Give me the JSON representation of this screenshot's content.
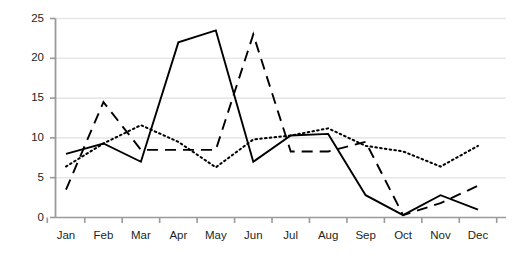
{
  "chart_data": {
    "type": "line",
    "title": "",
    "subtitle": "",
    "xlabel": "",
    "ylabel": "",
    "categories": [
      "Jan",
      "Feb",
      "Mar",
      "Apr",
      "May",
      "Jun",
      "Jul",
      "Aug",
      "Sep",
      "Oct",
      "Nov",
      "Dec"
    ],
    "xlim": [
      0,
      11
    ],
    "ylim": [
      0,
      25
    ],
    "yticks": [
      0,
      5,
      10,
      15,
      20,
      25
    ],
    "ytick_labels": [
      "0",
      "5",
      "10",
      "15",
      "20",
      "25"
    ],
    "grid": "horizontal",
    "legend": "none",
    "series": [
      {
        "name": "series-solid",
        "style": "solid",
        "color": "#000000",
        "values": [
          8,
          9.3,
          7,
          22,
          23.5,
          7,
          10.3,
          10.5,
          2.8,
          0.3,
          2.8,
          1
        ]
      },
      {
        "name": "series-dashed",
        "style": "dashed",
        "color": "#000000",
        "values": [
          3.5,
          14.5,
          8.5,
          8.5,
          8.5,
          23,
          8.3,
          8.3,
          9.5,
          0.3,
          1.8,
          4
        ]
      },
      {
        "name": "series-dotted",
        "style": "dotted",
        "color": "#000000",
        "values": [
          6.4,
          9.3,
          11.6,
          9.5,
          6.3,
          9.8,
          10.3,
          11.2,
          9,
          8.3,
          6.4,
          9
        ]
      }
    ]
  },
  "axis": {
    "y_labels": [
      "25",
      "20",
      "15",
      "10",
      "5",
      "0"
    ],
    "x_labels": [
      "Jan",
      "Feb",
      "Mar",
      "Apr",
      "May",
      "Jun",
      "Jul",
      "Aug",
      "Sep",
      "Oct",
      "Nov",
      "Dec"
    ]
  },
  "colors": {
    "gridline": "#e8e8e8",
    "axis": "#9a9a9a",
    "text": "#231f20",
    "line": "#000000"
  }
}
